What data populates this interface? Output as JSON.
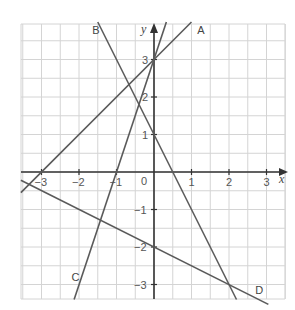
{
  "chart_data": {
    "type": "line",
    "title": "",
    "xlabel": "x",
    "ylabel": "y",
    "xlim": [
      -3.5,
      3.5
    ],
    "ylim": [
      -3.4,
      3.95
    ],
    "grid": true,
    "grid_step": 0.5,
    "x_ticks": [
      -3,
      -2,
      -1,
      0,
      1,
      2,
      3
    ],
    "x_tick_labels": [
      "−3",
      "−2",
      "−1",
      "0",
      "1",
      "2",
      "3"
    ],
    "y_ticks": [
      -3,
      -2,
      -1,
      1,
      2,
      3
    ],
    "y_tick_labels": [
      "−3",
      "−2",
      "−1",
      "1",
      "2",
      "3"
    ],
    "legend": "none (lines labelled directly)",
    "series": [
      {
        "name": "A",
        "equation": "y = x + 3",
        "points": [
          [
            -3.55,
            -0.55
          ],
          [
            1.0,
            4.0
          ]
        ],
        "label_pos": [
          1.15,
          3.8
        ]
      },
      {
        "name": "B",
        "equation": "y = -2x + 1",
        "points": [
          [
            -1.5,
            4.0
          ],
          [
            2.2,
            -3.4
          ]
        ],
        "label_pos": [
          -1.65,
          3.8
        ]
      },
      {
        "name": "C",
        "equation": "y = 3x + 3",
        "points": [
          [
            -2.13,
            -3.4
          ],
          [
            0.33,
            4.0
          ]
        ],
        "label_pos": [
          -2.2,
          -2.8
        ]
      },
      {
        "name": "D",
        "equation": "y = -0.5x - 2",
        "points": [
          [
            -3.55,
            -0.22
          ],
          [
            3.05,
            -3.53
          ]
        ],
        "label_pos": [
          2.7,
          -3.15
        ]
      }
    ],
    "intersections_marked": [
      [
        0,
        3
      ],
      [
        2,
        -3
      ]
    ]
  },
  "labels": {
    "x_axis": "x",
    "y_axis": "y",
    "origin": "0"
  }
}
